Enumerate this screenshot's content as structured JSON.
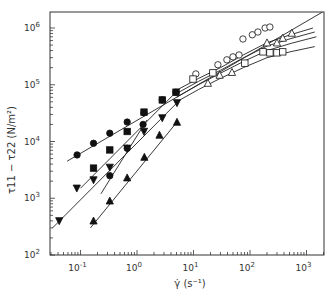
{
  "chart_data": {
    "type": "scatter",
    "title": "",
    "xlabel": "γ̇ (s⁻¹)",
    "ylabel": "τ11 − τ22 (N/m²)",
    "xscale": "log",
    "yscale": "log",
    "xlim": [
      0.029,
      2050
    ],
    "ylim": [
      100,
      1900000
    ],
    "x_ticks": [
      {
        "value": 0.1,
        "label": "10",
        "exp": "-1"
      },
      {
        "value": 1,
        "label": "10",
        "exp": "0"
      },
      {
        "value": 10,
        "label": "10",
        "exp": "1"
      },
      {
        "value": 100,
        "label": "10",
        "exp": "2"
      },
      {
        "value": 1000,
        "label": "10",
        "exp": "3"
      }
    ],
    "y_ticks": [
      {
        "value": 100,
        "label": "10",
        "exp": "2"
      },
      {
        "value": 1000,
        "label": "10",
        "exp": "3"
      },
      {
        "value": 10000,
        "label": "10",
        "exp": "4"
      },
      {
        "value": 100000,
        "label": "10",
        "exp": "5"
      },
      {
        "value": 1000000,
        "label": "10",
        "exp": "6"
      }
    ],
    "grid": false,
    "legend": null,
    "series": [
      {
        "name": "filled-circles-upper",
        "marker": "circle",
        "filled": true,
        "x": [
          0.087,
          0.17,
          0.33,
          0.67,
          1.33,
          2.8,
          4.9
        ],
        "y": [
          5800,
          9300,
          14000,
          22000,
          32000,
          54000,
          74000
        ],
        "fit": [
          [
            0.058,
            4500
          ],
          [
            1900,
            1900000
          ]
        ]
      },
      {
        "name": "filled-squares",
        "marker": "square",
        "filled": true,
        "x": [
          0.17,
          0.33,
          0.67,
          1.33,
          2.8,
          4.9
        ],
        "y": [
          3400,
          7100,
          15000,
          33000,
          54000,
          74000
        ],
        "fit": [
          [
            0.1,
            1500
          ],
          [
            4.9,
            74000
          ]
        ]
      },
      {
        "name": "filled-down-triangles",
        "marker": "triangle-down",
        "filled": true,
        "x": [
          0.042,
          0.086,
          0.17,
          0.33,
          0.67,
          1.33,
          2.8,
          5.1
        ],
        "y": [
          400,
          1500,
          2100,
          3500,
          7600,
          15000,
          26000,
          48000
        ],
        "fit": [
          [
            0.032,
            300
          ],
          [
            5.1,
            48000
          ]
        ]
      },
      {
        "name": "filled-circles-lower",
        "marker": "circle",
        "filled": true,
        "x": [
          0.33,
          0.67,
          1.28
        ],
        "y": [
          2500,
          7600,
          20000
        ],
        "fit": [
          [
            0.23,
            1200
          ],
          [
            1.5,
            24000
          ]
        ]
      },
      {
        "name": "filled-up-triangles",
        "marker": "triangle-up",
        "filled": true,
        "x": [
          0.17,
          0.33,
          0.67,
          1.35,
          2.5,
          5.1
        ],
        "y": [
          400,
          900,
          2300,
          5300,
          13000,
          22000
        ],
        "fit": [
          [
            0.15,
            300
          ],
          [
            5.1,
            22000
          ]
        ]
      },
      {
        "name": "open-circles",
        "marker": "circle",
        "filled": false,
        "x": [
          11,
          27,
          39,
          50,
          64,
          75,
          110,
          138,
          185,
          225
        ],
        "y": [
          155000,
          225000,
          275000,
          310000,
          335000,
          640000,
          760000,
          850000,
          1000000,
          1040000
        ]
      },
      {
        "name": "open-squares",
        "marker": "square",
        "filled": false,
        "x": [
          9.8,
          22,
          81,
          170,
          225,
          300,
          380
        ],
        "y": [
          126000,
          162000,
          240000,
          380000,
          365000,
          365000,
          380000
        ]
      },
      {
        "name": "open-up-triangles",
        "marker": "triangle-up",
        "filled": false,
        "x": [
          18,
          29,
          48,
          200,
          300,
          380,
          550
        ],
        "y": [
          107000,
          148000,
          166000,
          550000,
          550000,
          665000,
          815000
        ]
      }
    ],
    "curves": [
      {
        "name": "curve-1",
        "points": [
          [
            5,
            80000
          ],
          [
            30,
            200000
          ],
          [
            200,
            550000
          ],
          [
            1300,
            1000000
          ]
        ]
      },
      {
        "name": "curve-2",
        "points": [
          [
            5,
            70000
          ],
          [
            30,
            180000
          ],
          [
            200,
            480000
          ],
          [
            1400,
            850000
          ]
        ]
      },
      {
        "name": "curve-3",
        "points": [
          [
            5,
            60000
          ],
          [
            30,
            160000
          ],
          [
            200,
            400000
          ],
          [
            1500,
            700000
          ]
        ]
      },
      {
        "name": "curve-4",
        "points": [
          [
            5,
            50000
          ],
          [
            30,
            130000
          ],
          [
            200,
            300000
          ],
          [
            1400,
            470000
          ]
        ]
      }
    ]
  }
}
